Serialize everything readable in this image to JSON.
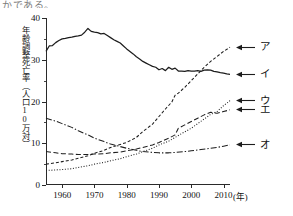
{
  "page": {
    "cut_off_text": "かである。"
  },
  "axes": {
    "y_label": "年齢調整死亡率（人口10万対）",
    "y_ticks": [
      0,
      10,
      20,
      30,
      40
    ],
    "y_range": [
      0,
      40
    ],
    "x_ticks": [
      1960,
      1970,
      1980,
      1990,
      2000,
      2010
    ],
    "x_range": [
      1955,
      2012
    ],
    "x_unit": "(年)"
  },
  "legend": {
    "position": "right",
    "items": [
      {
        "key": "a",
        "label": "ア",
        "style": "dotted",
        "end_value": 33.0
      },
      {
        "key": "i",
        "label": "イ",
        "style": "solid",
        "end_value": 26.5
      },
      {
        "key": "u",
        "label": "ウ",
        "style": "fine-dotted",
        "end_value": 20.2
      },
      {
        "key": "e",
        "label": "エ",
        "style": "dashed",
        "end_value": 18.0
      },
      {
        "key": "o",
        "label": "オ",
        "style": "dash-dot",
        "end_value": 9.6
      }
    ]
  },
  "chart_data": {
    "type": "line",
    "title": "",
    "xlabel": "(年)",
    "ylabel": "年齢調整死亡率（人口10万対）",
    "xlim": [
      1955,
      2012
    ],
    "ylim": [
      0,
      40
    ],
    "grid": false,
    "legend_position": "right",
    "series": [
      {
        "name": "ア",
        "style": "dotted",
        "x": [
          1955,
          1958,
          1960,
          1963,
          1965,
          1968,
          1970,
          1973,
          1975,
          1978,
          1980,
          1983,
          1985,
          1988,
          1990,
          1992,
          1994,
          1995,
          1996,
          1998,
          2000,
          2002,
          2004,
          2006,
          2008,
          2010,
          2012
        ],
        "values": [
          5.0,
          5.3,
          5.6,
          6.0,
          6.4,
          7.0,
          7.6,
          8.3,
          9.0,
          9.7,
          10.2,
          11.4,
          12.8,
          14.6,
          16.4,
          18.2,
          19.9,
          21.5,
          22.0,
          23.4,
          25.0,
          26.6,
          28.2,
          29.6,
          30.8,
          32.0,
          33.0
        ]
      },
      {
        "name": "イ",
        "style": "solid",
        "x": [
          1955,
          1956,
          1957,
          1958,
          1959,
          1960,
          1961,
          1962,
          1963,
          1964,
          1965,
          1966,
          1967,
          1968,
          1969,
          1970,
          1971,
          1972,
          1973,
          1974,
          1975,
          1976,
          1977,
          1978,
          1979,
          1980,
          1981,
          1982,
          1983,
          1984,
          1985,
          1986,
          1987,
          1988,
          1989,
          1990,
          1991,
          1992,
          1993,
          1994,
          1995,
          1996,
          1997,
          1998,
          1999,
          2000,
          2001,
          2002,
          2003,
          2004,
          2005,
          2006,
          2007,
          2008,
          2009,
          2010,
          2011,
          2012
        ],
        "values": [
          32.0,
          33.3,
          33.4,
          34.1,
          34.6,
          35.0,
          35.1,
          35.3,
          35.4,
          35.6,
          35.7,
          35.9,
          36.6,
          37.5,
          36.8,
          36.6,
          36.5,
          36.2,
          36.3,
          35.8,
          35.3,
          34.8,
          34.4,
          34.0,
          33.3,
          32.6,
          32.0,
          31.4,
          30.7,
          30.2,
          29.6,
          29.2,
          28.8,
          28.4,
          28.2,
          27.6,
          27.9,
          27.4,
          28.2,
          27.7,
          28.0,
          27.3,
          27.3,
          27.2,
          27.4,
          27.3,
          27.3,
          27.4,
          27.2,
          27.5,
          27.6,
          27.5,
          27.2,
          27.1,
          26.9,
          26.8,
          26.6,
          26.5
        ]
      },
      {
        "name": "ウ",
        "style": "fine-dotted",
        "x": [
          1955,
          1958,
          1960,
          1963,
          1965,
          1968,
          1970,
          1973,
          1975,
          1978,
          1980,
          1983,
          1985,
          1988,
          1990,
          1993,
          1995,
          1997,
          2000,
          2002,
          2004,
          2006,
          2008,
          2010,
          2012
        ],
        "values": [
          3.5,
          3.6,
          3.7,
          3.9,
          4.2,
          4.6,
          5.0,
          5.4,
          5.8,
          6.3,
          6.8,
          7.4,
          8.0,
          8.8,
          9.6,
          10.5,
          11.4,
          12.3,
          13.6,
          14.7,
          15.8,
          16.9,
          17.6,
          19.0,
          20.2
        ]
      },
      {
        "name": "エ",
        "style": "dashed",
        "x": [
          1955,
          1958,
          1960,
          1963,
          1965,
          1968,
          1970,
          1973,
          1975,
          1978,
          1980,
          1983,
          1985,
          1988,
          1990,
          1993,
          1995,
          1996,
          1998,
          2000,
          2002,
          2004,
          2006,
          2008,
          2010,
          2012
        ],
        "values": [
          8.0,
          7.7,
          7.5,
          7.4,
          7.3,
          7.3,
          7.4,
          7.5,
          7.7,
          7.9,
          8.2,
          8.6,
          9.0,
          9.6,
          10.2,
          11.2,
          12.0,
          13.6,
          14.4,
          15.2,
          16.0,
          16.8,
          17.4,
          17.2,
          17.6,
          18.0
        ]
      },
      {
        "name": "オ",
        "style": "dash-dot",
        "x": [
          1955,
          1958,
          1960,
          1963,
          1965,
          1968,
          1970,
          1973,
          1975,
          1978,
          1980,
          1983,
          1985,
          1988,
          1990,
          1993,
          1995,
          1998,
          2000,
          2003,
          2006,
          2008,
          2010,
          2012
        ],
        "values": [
          16.0,
          15.3,
          14.7,
          13.8,
          13.0,
          12.0,
          11.2,
          10.4,
          9.8,
          9.2,
          8.8,
          8.3,
          8.0,
          7.8,
          7.7,
          7.7,
          7.8,
          8.0,
          8.2,
          8.5,
          8.8,
          9.0,
          9.3,
          9.6
        ]
      }
    ]
  }
}
